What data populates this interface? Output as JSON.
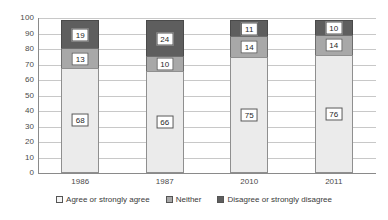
{
  "chart_data": {
    "type": "bar",
    "subtype": "stacked-bar-100",
    "title": "",
    "xlabel": "",
    "ylabel": "",
    "ylim": [
      0,
      100
    ],
    "yticks": [
      0,
      10,
      20,
      30,
      40,
      50,
      60,
      70,
      80,
      90,
      100
    ],
    "ytick_labels": [
      "0",
      "10",
      "20",
      "30",
      "40",
      "50",
      "60",
      "70",
      "80",
      "90",
      "100"
    ],
    "grid": true,
    "legend_position": "bottom",
    "categories": [
      "1986",
      "1987",
      "2010",
      "2011"
    ],
    "series": [
      {
        "name": "Agree or strongly agree",
        "color": "#ebebeb",
        "values": [
          68,
          66,
          75,
          76
        ],
        "labels": [
          "68",
          "66",
          "75",
          "76"
        ]
      },
      {
        "name": "Neither",
        "color": "#a8a8a8",
        "values": [
          13,
          10,
          14,
          14
        ],
        "labels": [
          "13",
          "10",
          "14",
          "14"
        ]
      },
      {
        "name": "Disagree or strongly disagree",
        "color": "#5e5e5e",
        "values": [
          19,
          24,
          11,
          10
        ],
        "labels": [
          "19",
          "24",
          "11",
          "10"
        ]
      }
    ]
  },
  "legend": {
    "items": [
      {
        "label": "Agree or strongly agree",
        "swatch": "agree"
      },
      {
        "label": "Neither",
        "swatch": "neither"
      },
      {
        "label": "Disagree or strongly disagree",
        "swatch": "disagree"
      }
    ]
  }
}
